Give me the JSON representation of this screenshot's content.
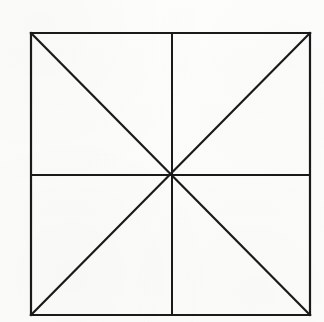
{
  "figure": {
    "title": "Square with midlines and diagonals",
    "medium": "black ink line drawing on off-white paper",
    "canvas": {
      "width": 324,
      "height": 322,
      "background_color": "#fdfdfc"
    },
    "style": {
      "line_color": "#1a1a1a",
      "border_stroke_width": 2.2,
      "midline_stroke_width": 2.0,
      "diagonal_stroke_width": 2.2
    },
    "square": {
      "left": 31,
      "top": 33,
      "right": 310,
      "bottom": 315,
      "width": 279,
      "height": 282
    },
    "center_point": {
      "x": 172,
      "y": 175
    },
    "vertices": [
      {
        "name": "top-left",
        "x": 31,
        "y": 33
      },
      {
        "name": "top-right",
        "x": 310,
        "y": 33
      },
      {
        "name": "bottom-right",
        "x": 310,
        "y": 315
      },
      {
        "name": "bottom-left",
        "x": 31,
        "y": 315
      }
    ],
    "segments": [
      {
        "name": "border-top",
        "x1": 31,
        "y1": 33,
        "x2": 310,
        "y2": 33,
        "kind": "border"
      },
      {
        "name": "border-right",
        "x1": 310,
        "y1": 33,
        "x2": 310,
        "y2": 315,
        "kind": "border"
      },
      {
        "name": "border-bottom",
        "x1": 310,
        "y1": 315,
        "x2": 31,
        "y2": 315,
        "kind": "border"
      },
      {
        "name": "border-left",
        "x1": 31,
        "y1": 315,
        "x2": 31,
        "y2": 33,
        "kind": "border"
      },
      {
        "name": "midline-horizontal",
        "x1": 31,
        "y1": 175,
        "x2": 310,
        "y2": 175,
        "kind": "midline"
      },
      {
        "name": "midline-vertical",
        "x1": 172,
        "y1": 33,
        "x2": 172,
        "y2": 315,
        "kind": "midline"
      },
      {
        "name": "diagonal-tl-br",
        "x1": 31,
        "y1": 33,
        "x2": 310,
        "y2": 315,
        "kind": "diagonal"
      },
      {
        "name": "diagonal-tr-bl",
        "x1": 310,
        "y1": 33,
        "x2": 31,
        "y2": 315,
        "kind": "diagonal"
      }
    ],
    "counts": {
      "triangular_sectors": 8,
      "quadrants": 4,
      "lines_through_center": 4
    }
  }
}
